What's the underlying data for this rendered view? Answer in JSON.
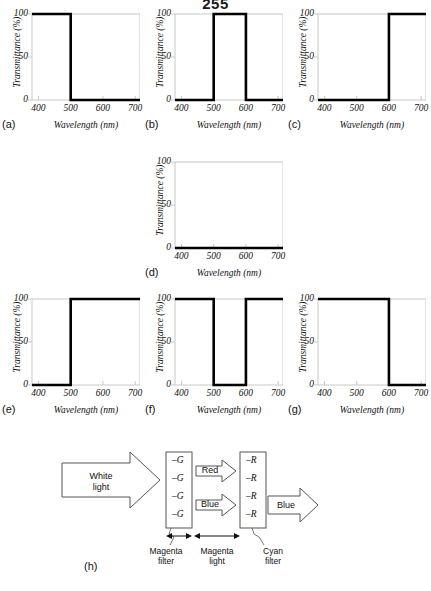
{
  "page": {
    "number": "255"
  },
  "chart_data": [
    {
      "id": "a",
      "panel_label": "(a)",
      "type": "line",
      "title": "",
      "xlabel": "Wavelength (nm)",
      "ylabel": "Transmittance (%)",
      "xlim": [
        380,
        715
      ],
      "ylim": [
        0,
        100
      ],
      "xticks": [
        400,
        500,
        600,
        700
      ],
      "yticks": [
        0,
        50,
        100
      ],
      "grid": false,
      "legend": "none",
      "description": "Blue filter: passes 400-500 nm",
      "x": [
        380,
        500,
        500,
        715
      ],
      "y": [
        100,
        100,
        0,
        0
      ]
    },
    {
      "id": "b",
      "panel_label": "(b)",
      "type": "line",
      "title": "",
      "xlabel": "Wavelength (nm)",
      "ylabel": "Transmittance (%)",
      "xlim": [
        380,
        715
      ],
      "ylim": [
        0,
        100
      ],
      "xticks": [
        400,
        500,
        600,
        700
      ],
      "yticks": [
        0,
        50,
        100
      ],
      "grid": false,
      "legend": "none",
      "description": "Green filter: passes 500-600 nm",
      "x": [
        380,
        500,
        500,
        600,
        600,
        715
      ],
      "y": [
        0,
        0,
        100,
        100,
        0,
        0
      ]
    },
    {
      "id": "c",
      "panel_label": "(c)",
      "type": "line",
      "title": "",
      "xlabel": "Wavelength (nm)",
      "ylabel": "Transmittance (%)",
      "xlim": [
        380,
        715
      ],
      "ylim": [
        0,
        100
      ],
      "xticks": [
        400,
        500,
        600,
        700
      ],
      "yticks": [
        0,
        50,
        100
      ],
      "grid": false,
      "legend": "none",
      "description": "Red filter: passes 600-700 nm",
      "x": [
        380,
        600,
        600,
        715
      ],
      "y": [
        0,
        0,
        100,
        100
      ]
    },
    {
      "id": "d",
      "panel_label": "(d)",
      "type": "line",
      "title": "",
      "xlabel": "Wavelength (nm)",
      "ylabel": "Transmittance (%)",
      "xlim": [
        380,
        715
      ],
      "ylim": [
        0,
        100
      ],
      "xticks": [
        400,
        500,
        600,
        700
      ],
      "yticks": [
        0,
        50,
        100
      ],
      "grid": false,
      "legend": "none",
      "description": "Black filter: blocks all wavelengths",
      "x": [
        380,
        715
      ],
      "y": [
        0,
        0
      ]
    },
    {
      "id": "e",
      "panel_label": "(e)",
      "type": "line",
      "title": "",
      "xlabel": "Wavelength (nm)",
      "ylabel": "Transmittance (%)",
      "xlim": [
        380,
        715
      ],
      "ylim": [
        0,
        100
      ],
      "xticks": [
        400,
        500,
        600,
        700
      ],
      "yticks": [
        0,
        50,
        100
      ],
      "grid": false,
      "legend": "none",
      "description": "Yellow filter: passes 500-700 nm",
      "x": [
        380,
        500,
        500,
        715
      ],
      "y": [
        0,
        0,
        100,
        100
      ]
    },
    {
      "id": "f",
      "panel_label": "(f)",
      "type": "line",
      "title": "",
      "xlabel": "Wavelength (nm)",
      "ylabel": "Transmittance (%)",
      "xlim": [
        380,
        715
      ],
      "ylim": [
        0,
        100
      ],
      "xticks": [
        400,
        500,
        600,
        700
      ],
      "yticks": [
        0,
        50,
        100
      ],
      "grid": false,
      "legend": "none",
      "description": "Magenta filter: passes 400-500 and 600-700 nm",
      "x": [
        380,
        500,
        500,
        600,
        600,
        715
      ],
      "y": [
        100,
        100,
        0,
        0,
        100,
        100
      ]
    },
    {
      "id": "g",
      "panel_label": "(g)",
      "type": "line",
      "title": "",
      "xlabel": "Wavelength (nm)",
      "ylabel": "Transmittance (%)",
      "xlim": [
        380,
        715
      ],
      "ylim": [
        0,
        100
      ],
      "xticks": [
        400,
        500,
        600,
        700
      ],
      "yticks": [
        0,
        50,
        100
      ],
      "grid": false,
      "legend": "none",
      "description": "Cyan filter: passes 400-600 nm",
      "x": [
        380,
        600,
        600,
        715
      ],
      "y": [
        100,
        100,
        0,
        0
      ]
    }
  ],
  "diagram": {
    "panel_label": "(h)",
    "input_arrow_label": "White\nlight",
    "input_arrow_line1": "White",
    "input_arrow_line2": "light",
    "magenta_filter": {
      "symbols": [
        "–G",
        "–G",
        "–G",
        "–G"
      ],
      "caption_line1": "Magenta",
      "caption_line2": "filter"
    },
    "middle_arrows": [
      {
        "label": "Red"
      },
      {
        "label": "Blue"
      }
    ],
    "middle_caption_line1": "Magenta",
    "middle_caption_line2": "light",
    "cyan_filter": {
      "symbols": [
        "–R",
        "–R",
        "–R",
        "–R"
      ],
      "caption_line1": "Cyan",
      "caption_line2": "filter"
    },
    "output_arrow_label": "Blue"
  },
  "colors": {
    "ink": "#111111",
    "frame": "#c8c8c8",
    "curve": "#000000",
    "background": "#ffffff"
  }
}
